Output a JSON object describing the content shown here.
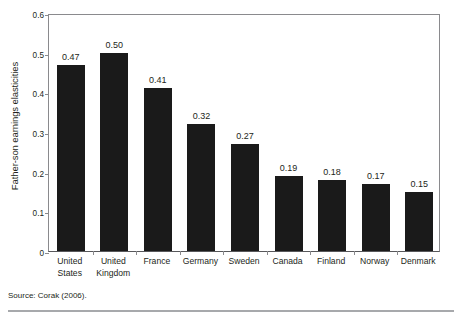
{
  "figure": {
    "background_color": "#ffffff",
    "axis_color": "#8a8a8d",
    "bar_color": "#1a1a1a",
    "text_color": "#231f20",
    "rule_color": "#a7a9ac"
  },
  "source_note": "Source: Corak (2006).",
  "chart_data": {
    "type": "bar",
    "title": "",
    "subtitle": "",
    "xlabel": "",
    "ylabel": "Father-son earnings elasticities",
    "categories": [
      "United States",
      "United Kingdom",
      "France",
      "Germany",
      "Sweden",
      "Canada",
      "Finland",
      "Norway",
      "Denmark"
    ],
    "category_lines": [
      [
        "United",
        "States"
      ],
      [
        "United",
        "Kingdom"
      ],
      [
        "France"
      ],
      [
        "Germany"
      ],
      [
        "Sweden"
      ],
      [
        "Canada"
      ],
      [
        "Finland"
      ],
      [
        "Norway"
      ],
      [
        "Denmark"
      ]
    ],
    "values": [
      0.47,
      0.5,
      0.41,
      0.32,
      0.27,
      0.19,
      0.18,
      0.17,
      0.15
    ],
    "value_labels": [
      "0.47",
      "0.50",
      "0.41",
      "0.32",
      "0.27",
      "0.19",
      "0.18",
      "0.17",
      "0.15"
    ],
    "ylim": [
      0,
      0.6
    ],
    "yticks": [
      0,
      0.1,
      0.2,
      0.3,
      0.4,
      0.5,
      0.6
    ],
    "ytick_labels": [
      "0",
      "0.1",
      "0.2",
      "0.3",
      "0.4",
      "0.5",
      "0.6"
    ],
    "grid": false,
    "legend": null,
    "orientation": "vertical",
    "bar_color": "#1a1a1a",
    "data_labels_shown": true
  }
}
